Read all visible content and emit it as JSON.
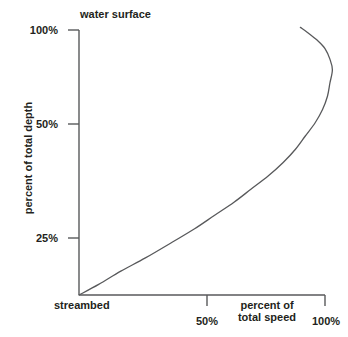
{
  "figure": {
    "background": "#ffffff",
    "ink": "#231f20",
    "axis_color": "#58595b",
    "curve_color": "#58595b"
  },
  "annotations": {
    "water_surface": "water surface",
    "streambed": "streambed"
  },
  "axes": {
    "y": {
      "title": "percent of total depth",
      "ticks": [
        {
          "label": "100%",
          "value": 100
        },
        {
          "label": "50%",
          "value": 50
        },
        {
          "label": "25%",
          "value": 25
        }
      ]
    },
    "x": {
      "title_line1": "percent of",
      "title_line2": "total speed",
      "ticks": [
        {
          "label": "50%",
          "value": 50
        },
        {
          "label": "100%",
          "value": 100
        }
      ]
    }
  },
  "chart_data": {
    "type": "line",
    "title": "",
    "subtitle": "",
    "xlabel": "percent of total speed",
    "ylabel": "percent of total depth",
    "xlim": [
      0,
      100
    ],
    "ylim": [
      0,
      100
    ],
    "grid": false,
    "legend": null,
    "annotations": [
      {
        "text": "water surface",
        "x": 0,
        "y": 100,
        "position": "above-axis-top"
      },
      {
        "text": "streambed",
        "x": 0,
        "y": 0,
        "position": "below-axis-origin"
      }
    ],
    "xticks": [
      50,
      100
    ],
    "xticklabels": [
      "50%",
      "100%"
    ],
    "yticks": [
      25,
      50,
      100
    ],
    "yticklabels": [
      "25%",
      "50%",
      "100%"
    ],
    "series": [
      {
        "name": "stream velocity profile",
        "x": [
          0,
          8,
          17,
          27,
          38,
          47,
          55,
          63,
          70,
          77,
          83,
          88,
          92,
          96,
          99,
          101,
          102,
          103,
          102,
          100,
          97,
          93,
          90
        ],
        "y": [
          0,
          4,
          9,
          14,
          20,
          25,
          30,
          35,
          40,
          45,
          50,
          55,
          60,
          65,
          70,
          75,
          80,
          85,
          89,
          93,
          96,
          99,
          101
        ]
      }
    ]
  }
}
